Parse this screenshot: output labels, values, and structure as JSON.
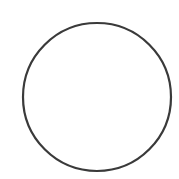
{
  "canvas": {
    "width": 179,
    "height": 179,
    "background": "#ffffff"
  },
  "shape": {
    "type": "circle",
    "cx": 97,
    "cy": 97,
    "r": 74,
    "stroke": "#3a3a3a",
    "stroke_width": 2.2,
    "fill": "none"
  }
}
